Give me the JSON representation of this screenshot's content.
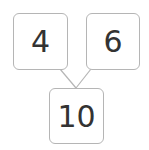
{
  "number_bond": {
    "part_left": "4",
    "part_right": "6",
    "whole": "10"
  },
  "colors": {
    "border": "#b5b5b5",
    "text": "#333333",
    "background": "#ffffff"
  }
}
